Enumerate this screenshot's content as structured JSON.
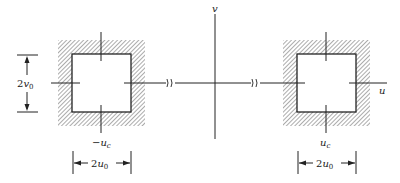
{
  "diagram": {
    "type": "frequency-plane passband diagram",
    "axes": {
      "horizontal_label": "u",
      "vertical_label": "v"
    },
    "left_passband": {
      "center_label_prefix": "−",
      "center_label": "u",
      "center_subscript": "c",
      "width_label_coeff": "2",
      "width_label_var": "u",
      "width_label_sub": "0"
    },
    "right_passband": {
      "center_label": "u",
      "center_subscript": "c",
      "width_label_coeff": "2",
      "width_label_var": "u",
      "width_label_sub": "0"
    },
    "height_dimension": {
      "label_coeff": "2",
      "label_var": "v",
      "label_sub": "0"
    },
    "axis_breaks": [
      "≈",
      "≈"
    ],
    "colors": {
      "line": "#222222",
      "hatch": "#555555",
      "background": "#ffffff"
    }
  }
}
